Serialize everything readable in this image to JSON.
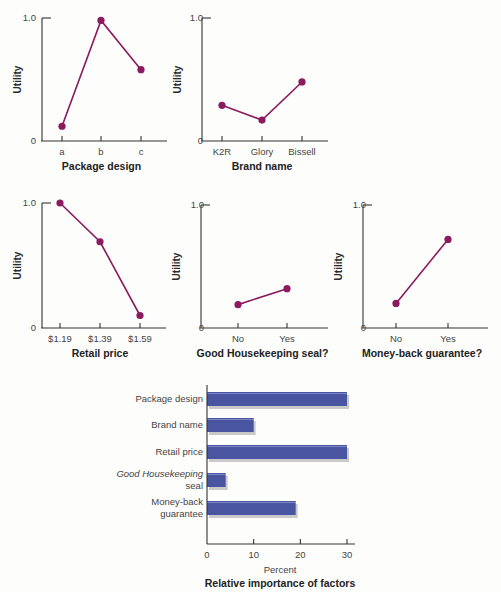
{
  "chart_data": [
    {
      "type": "line",
      "title": "Package design",
      "xlabel": "Package design",
      "ylabel": "Utility",
      "categories": [
        "a",
        "b",
        "c"
      ],
      "values": [
        0.12,
        0.98,
        0.58
      ],
      "ylim": [
        0,
        1.0
      ],
      "yticks": [
        "0",
        "1.0"
      ],
      "grid": false
    },
    {
      "type": "line",
      "title": "Brand name",
      "xlabel": "Brand name",
      "ylabel": "Utility",
      "categories": [
        "K2R",
        "Glory",
        "Bissell"
      ],
      "values": [
        0.29,
        0.17,
        0.48
      ],
      "ylim": [
        0,
        1.0
      ],
      "yticks": [
        "0",
        "1.0"
      ],
      "grid": false
    },
    {
      "type": "line",
      "title": "Retail price",
      "xlabel": "Retail price",
      "ylabel": "Utility",
      "categories": [
        "$1.19",
        "$1.39",
        "$1.59"
      ],
      "values": [
        1.0,
        0.69,
        0.1
      ],
      "ylim": [
        0,
        1.0
      ],
      "yticks": [
        "0",
        "1.0"
      ],
      "grid": false
    },
    {
      "type": "line",
      "title": "Good Housekeeping seal?",
      "xlabel": "Good Housekeeping seal?",
      "ylabel": "Utility",
      "categories": [
        "No",
        "Yes"
      ],
      "values": [
        0.19,
        0.32
      ],
      "ylim": [
        0,
        1.0
      ],
      "yticks": [
        "0",
        "1.0"
      ],
      "grid": false
    },
    {
      "type": "line",
      "title": "Money-back guarantee?",
      "xlabel": "Money-back guarantee?",
      "ylabel": "Utility",
      "categories": [
        "No",
        "Yes"
      ],
      "values": [
        0.2,
        0.72
      ],
      "ylim": [
        0,
        1.0
      ],
      "yticks": [
        "0",
        "1.0"
      ],
      "grid": false
    },
    {
      "type": "bar",
      "orientation": "horizontal",
      "title": "Relative importance of factors",
      "xlabel": "Percent",
      "ylabel": "",
      "categories": [
        "Package design",
        "Brand name",
        "Retail price",
        "Good Housekeeping seal",
        "Money-back guarantee"
      ],
      "values": [
        30,
        10,
        30,
        4,
        19
      ],
      "xlim": [
        0,
        32
      ],
      "xticks": [
        "0",
        "10",
        "20",
        "30"
      ],
      "grid": false
    }
  ],
  "colors": {
    "line": "#8b1a5e",
    "marker": "#8b1a5e",
    "bar": "#4a55a2",
    "bar_shadow": "#c9c9c9",
    "axis": "#333333"
  },
  "labels": {
    "utility": "Utility",
    "zero": "0",
    "one": "1.0",
    "percent": "Percent",
    "bar_title": "Relative importance of factors",
    "gh_line1": "Good Housekeeping",
    "gh_line2": "seal",
    "mb_line1": "Money-back",
    "mb_line2": "guarantee"
  }
}
